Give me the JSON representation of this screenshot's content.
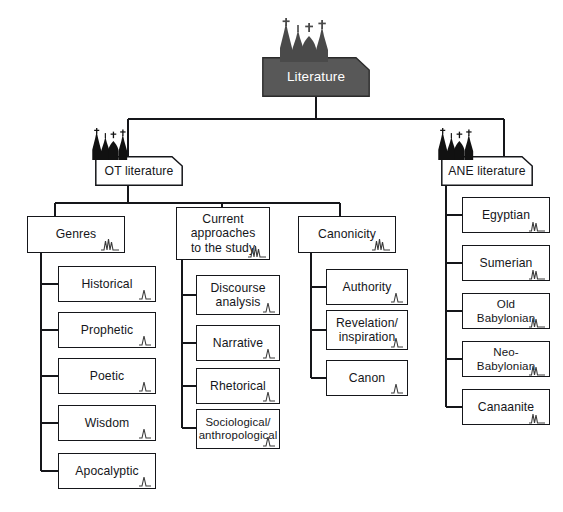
{
  "diagram": {
    "title": "Literature",
    "type": "tree-diagram",
    "colors": {
      "root_fill": "#585858",
      "root_text": "#ffffff",
      "node_fill": "#ffffff",
      "node_border": "#15161a",
      "connector": "#15161a",
      "background": "#ffffff"
    },
    "root": {
      "label": "Literature"
    },
    "branches": [
      {
        "label": "OT literature",
        "groups": [
          {
            "label": "Genres",
            "items": [
              {
                "label": "Historical"
              },
              {
                "label": "Prophetic"
              },
              {
                "label": "Poetic"
              },
              {
                "label": "Wisdom"
              },
              {
                "label": "Apocalyptic"
              }
            ]
          },
          {
            "label": "Current\napproaches\nto the study",
            "items": [
              {
                "label": "Discourse\nanalysis"
              },
              {
                "label": "Narrative"
              },
              {
                "label": "Rhetorical"
              },
              {
                "label": "Sociological/\nanthropological"
              }
            ]
          },
          {
            "label": "Canonicity",
            "items": [
              {
                "label": "Authority"
              },
              {
                "label": "Revelation/\ninspiration"
              },
              {
                "label": "Canon"
              }
            ]
          }
        ]
      },
      {
        "label": "ANE literature",
        "groups": [],
        "items": [
          {
            "label": "Egyptian"
          },
          {
            "label": "Sumerian"
          },
          {
            "label": "Old Babylonian"
          },
          {
            "label": "Neo-Babylonian"
          },
          {
            "label": "Canaanite"
          }
        ]
      }
    ],
    "decorations": {
      "root_church": "cathedral-silhouette-icon",
      "branch_church": "cathedral-silhouette-icon",
      "node_spark": "spire-squiggle-icon"
    }
  }
}
